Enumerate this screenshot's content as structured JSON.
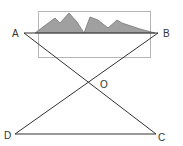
{
  "diagram": {
    "type": "geometry-crossed-lines",
    "labels": {
      "A": "A",
      "B": "B",
      "C": "C",
      "D": "D",
      "O": "O"
    },
    "points": {
      "A": [
        24,
        33
      ],
      "B": [
        158,
        33
      ],
      "C": [
        156,
        134
      ],
      "D": [
        15,
        134
      ],
      "O": [
        89,
        83
      ]
    },
    "segments": [
      "AB",
      "AC",
      "BD",
      "DC"
    ],
    "colors": {
      "lines": "#333333",
      "mountain_fill": "#a0a0a0",
      "mountain_stroke": "#777777",
      "frame": "#b5b5b5",
      "text": "#333333"
    }
  }
}
